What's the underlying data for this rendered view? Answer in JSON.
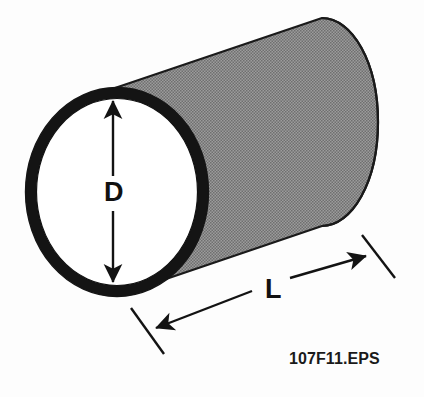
{
  "figure": {
    "name": "cylinder-dimension-diagram",
    "background_color": "#fdfdfd",
    "body_fill_color": "#8a8a8a",
    "outline_color": "#1a1a1a",
    "wall_ring_color": "#141414"
  },
  "dimensions": {
    "diameter": {
      "label": "D",
      "icon": "double-headed-vertical-arrow",
      "orientation": "vertical",
      "from_px": [
        113,
        100
      ],
      "to_px": [
        113,
        283
      ]
    },
    "length": {
      "label": "L",
      "icon": "double-headed-diagonal-arrow",
      "orientation": "diagonal",
      "from_px": [
        155,
        329
      ],
      "to_px": [
        367,
        256
      ]
    }
  },
  "caption": {
    "text": "107F11.EPS"
  },
  "geometry": {
    "front_face": {
      "shape": "ellipse",
      "center_px": [
        117,
        192
      ],
      "radius_x_px": 90,
      "radius_y_px": 103,
      "wall_thickness_px": 9
    },
    "far_end": {
      "shape": "ellipse",
      "center_px": [
        318,
        122
      ],
      "radius_x_px": 60,
      "radius_y_px": 104
    }
  }
}
